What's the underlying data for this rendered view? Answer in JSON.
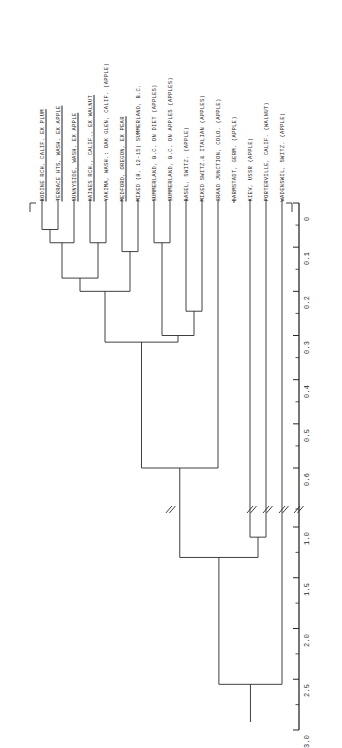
{
  "chart_data": {
    "type": "dendrogram",
    "title": "",
    "orientation": "vertical-hanging",
    "axis": {
      "label": "",
      "ticks_major": [
        "0",
        "0.1",
        "0.2",
        "0.3",
        "0.4",
        "0.5",
        "0.6",
        "1.0",
        "1.5",
        "2.0",
        "2.5",
        "3.0"
      ],
      "minor_ticks_between_majors": 1,
      "range_upper": [
        0,
        0.6
      ],
      "range_lower": [
        1.0,
        3.0
      ],
      "has_axis_break": true,
      "break_symbol": "//",
      "break_between": [
        "0.6",
        "1.0"
      ]
    },
    "leaves": [
      {
        "index": 0,
        "label": "BODINE RCH, CALIF. EX PLUM",
        "underlined": true
      },
      {
        "index": 1,
        "label": "TERRACE HTS, WASH. EX APPLE",
        "underlined": true
      },
      {
        "index": 2,
        "label": "SUNNYSIDE, WASH. EX APPLE",
        "underlined": true
      },
      {
        "index": 3,
        "label": "HAINES RCH., CALIF., EX WALNUT",
        "underlined": true
      },
      {
        "index": 4,
        "label": "YAKIMA, WASH.: OAK GLEN, CALIF. (APPLE)",
        "underlined": false
      },
      {
        "index": 5,
        "label": "MEDFORD, OREGON, EX PEAR",
        "underlined": true
      },
      {
        "index": 6,
        "label": "MIXED (8, 12-15) SUMMERLAND, B.C.",
        "underlined": false
      },
      {
        "index": 7,
        "label": "SUMMERLAND, B.C. ON DIET (APPLES)",
        "underlined": false
      },
      {
        "index": 8,
        "label": "SUMMERLAND, B.C. ON APPLES (APPLES)",
        "underlined": false
      },
      {
        "index": 9,
        "label": "BASEL, SWITZ. (APPLE)",
        "underlined": false
      },
      {
        "index": 10,
        "label": "MIXED SWITZ.& ITALIAN (APPLES)",
        "underlined": false
      },
      {
        "index": 11,
        "label": "GRAND JUNCTION, COLO. (APPLE)",
        "underlined": false
      },
      {
        "index": 12,
        "label": "DARMSTADT, GERM. (APPLE)",
        "underlined": false
      },
      {
        "index": 13,
        "label": "KIEV, USSR (APPLE)",
        "underlined": false
      },
      {
        "index": 14,
        "label": "PORTERVILLE, CALIF. (WALNUT)",
        "underlined": false
      },
      {
        "index": 15,
        "label": "WADENSWIL, SWITZ. (APPLE)",
        "underlined": false
      }
    ],
    "merges": [
      {
        "id": "m1",
        "children": [
          0,
          1
        ],
        "height": 0.06
      },
      {
        "id": "m2",
        "children": [
          "m1",
          2
        ],
        "height": 0.09
      },
      {
        "id": "m3",
        "children": [
          3,
          4
        ],
        "height": 0.09
      },
      {
        "id": "m4",
        "children": [
          "m2",
          "m3"
        ],
        "height": 0.17
      },
      {
        "id": "m5",
        "children": [
          5,
          6
        ],
        "height": 0.11
      },
      {
        "id": "m6",
        "children": [
          "m4",
          "m5"
        ],
        "height": 0.2
      },
      {
        "id": "m7",
        "children": [
          7,
          8
        ],
        "height": 0.09
      },
      {
        "id": "m8",
        "children": [
          9,
          10
        ],
        "height": 0.245
      },
      {
        "id": "m9",
        "children": [
          "m7",
          "m8"
        ],
        "height": 0.3
      },
      {
        "id": "m10",
        "children": [
          "m6",
          "m9"
        ],
        "height": 0.315
      },
      {
        "id": "m11",
        "children": [
          "m10",
          11
        ],
        "height": 0.6
      },
      {
        "id": "m12",
        "children": [
          13,
          14
        ],
        "height": 1.1
      },
      {
        "id": "m13",
        "children": [
          "m11",
          "m12"
        ],
        "height": 1.3
      },
      {
        "id": "m14",
        "children": [
          "m13",
          15
        ],
        "height": 2.55
      }
    ],
    "broken_branches": [
      "m11-left-stem",
      "leaf-12",
      "leaf-13",
      "leaf-14",
      "leaf-15"
    ],
    "grid": false,
    "legend": null
  },
  "figure": {
    "line_color": "#2a2a2a",
    "background": "#ffffff",
    "axis_color": "#1a1a1a"
  }
}
